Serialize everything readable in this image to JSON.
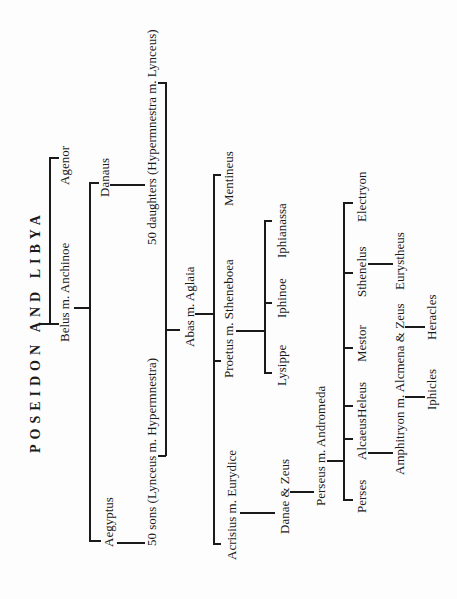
{
  "title": "POSEIDON AND LIBYA",
  "people": {
    "agenor": "Agenor",
    "belus": "Belus m. Anchinoe",
    "danaus": "Danaus",
    "aegyptus": "Aegyptus",
    "daughters": "50 daughters (Hypermnestra m. Lynceus)",
    "sons": "50 sons (Lynceus m. Hypermnestra)",
    "abas": "Abas m. Aglaia",
    "mentineus": "Mentineus",
    "proetus": "Proetus m. Stheneboea",
    "acrisius": "Acrisius m. Eurydice",
    "iphianassa": "Iphianassa",
    "iphinoe": "Iphinoe",
    "lysippe": "Lysippe",
    "danae": "Danae & Zeus",
    "perseus": "Perseus m. Andromeda",
    "electryon": "Electryon",
    "sthenelus": "Sthenelus",
    "mestor": "Mestor",
    "heleus": "Heleus",
    "alcaeus": "Alcaeus",
    "perses": "Perses",
    "eurystheus": "Eurystheus",
    "amphitryon": "Amphitryon m. Alcmena & Zeus",
    "heracles": "Heracles",
    "iphicles": "Iphicles"
  }
}
